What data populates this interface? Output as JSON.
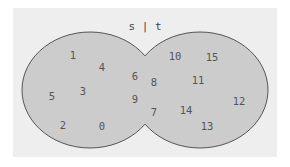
{
  "diagram": {
    "type": "venn",
    "title": "s | t",
    "operation": "union",
    "sets": [
      "s",
      "t"
    ],
    "shaded_regions": [
      "s_only",
      "intersection",
      "t_only"
    ],
    "colors": {
      "background": "#eeeeee",
      "fill": "#cccccc",
      "stroke": "#555555",
      "text": "#555555"
    },
    "elements": {
      "s_only": [
        "1",
        "4",
        "5",
        "3",
        "2",
        "0"
      ],
      "intersection": [
        "6",
        "9",
        "8",
        "7"
      ],
      "t_only": [
        "10",
        "15",
        "11",
        "12",
        "14",
        "13"
      ]
    },
    "labels": [
      {
        "text": "1"
      },
      {
        "text": "4"
      },
      {
        "text": "6"
      },
      {
        "text": "8"
      },
      {
        "text": "10"
      },
      {
        "text": "15"
      },
      {
        "text": "11"
      },
      {
        "text": "5"
      },
      {
        "text": "3"
      },
      {
        "text": "9"
      },
      {
        "text": "12"
      },
      {
        "text": "7"
      },
      {
        "text": "14"
      },
      {
        "text": "2"
      },
      {
        "text": "0"
      },
      {
        "text": "13"
      }
    ]
  }
}
